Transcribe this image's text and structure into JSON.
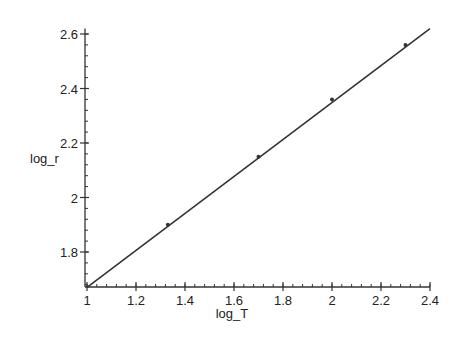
{
  "chart_data": {
    "type": "line",
    "title": "",
    "xlabel": "log_T",
    "ylabel": "log_r",
    "xlim": [
      1.0,
      2.4
    ],
    "ylim": [
      1.67,
      2.62
    ],
    "grid": false,
    "legend": null,
    "x_ticks": [
      1,
      1.2,
      1.4,
      1.6,
      1.8,
      2,
      2.2,
      2.4
    ],
    "x_tick_labels": [
      "1",
      "1.2",
      "1.4",
      "1.6",
      "1.8",
      "2",
      "2.2",
      "2.4"
    ],
    "y_ticks": [
      1.8,
      2.0,
      2.2,
      2.4,
      2.6
    ],
    "y_tick_labels": [
      "1.8",
      "2",
      "2.2",
      "2.4",
      "2.6"
    ],
    "series": [
      {
        "name": "fit-line",
        "style": "line",
        "x": [
          1.0,
          2.4
        ],
        "y": [
          1.67,
          2.62
        ]
      },
      {
        "name": "data-points",
        "style": "points",
        "x": [
          1.33,
          1.7,
          2.0,
          2.3
        ],
        "y": [
          1.9,
          2.15,
          2.36,
          2.56
        ]
      }
    ]
  },
  "colors": {
    "line": "#333333",
    "axis": "#333333",
    "background": "#ffffff"
  }
}
